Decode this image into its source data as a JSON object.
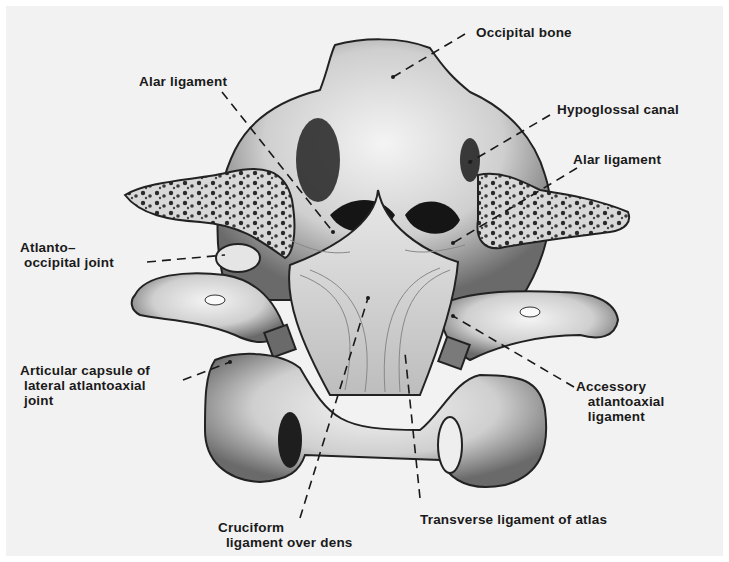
{
  "figure": {
    "background_color": "#f2f2f2",
    "line_color": "#1a1a1a"
  },
  "labels": {
    "occipital_bone": "Occipital bone",
    "alar_ligament_left": "Alar ligament",
    "hypoglossal_canal": "Hypoglossal canal",
    "alar_ligament_right": "Alar ligament",
    "atlanto_occipital_joint": "Atlanto–\n occipital joint",
    "articular_capsule": "Articular capsule of\n lateral atlantoaxial\n joint",
    "accessory_atlantoaxial": "Accessory\n   atlantoaxial\n   ligament",
    "cruciform_ligament": "Cruciform\n  ligament over dens",
    "transverse_ligament": "Transverse ligament of atlas"
  }
}
